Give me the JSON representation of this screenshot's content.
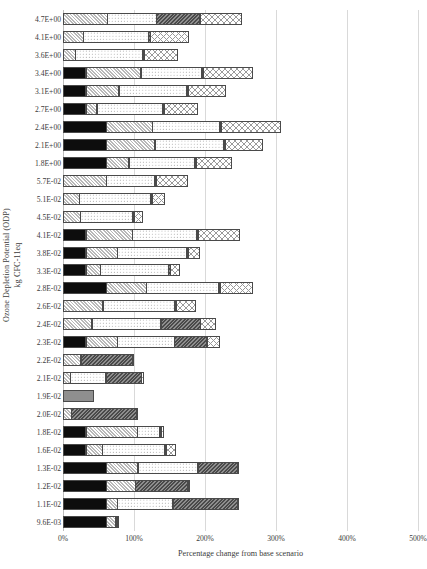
{
  "chart_data": {
    "type": "bar",
    "orientation": "horizontal",
    "stacked": true,
    "title": "",
    "xlabel": "Percentage change from base scenario",
    "ylabel": "Ozone Depletion Potential (ODP) kg CFC-11eq",
    "ylabel_lines": [
      "Ozone Depletion Potential (ODP)",
      "kg CFC-11eq"
    ],
    "xlim": [
      0,
      500
    ],
    "xticks": [
      0,
      100,
      200,
      300,
      400,
      500
    ],
    "xtick_labels": [
      "0%",
      "100%",
      "200%",
      "300%",
      "400%",
      "500%"
    ],
    "grid": true,
    "grid_axis": "x",
    "legend": "none",
    "categories": [
      "4.7E+00",
      "4.1E+00",
      "3.6E+00",
      "3.4E+00",
      "3.1E+00",
      "2.7E+00",
      "2.4E+00",
      "2.1E+00",
      "1.8E+00",
      "5.7E-02",
      "5.1E-02",
      "4.5E-02",
      "4.1E-02",
      "3.8E-02",
      "3.3E-02",
      "2.8E-02",
      "2.6E-02",
      "2.4E-02",
      "2.3E-02",
      "2.2E-02",
      "2.1E-02",
      "1.9E-02",
      "2.0E-02",
      "1.8E-02",
      "1.6E-02",
      "1.3E-02",
      "1.2E-02",
      "1.1E-02",
      "9.6E-03"
    ],
    "series": [
      {
        "name": "segment-1",
        "pattern": "p-black-dots",
        "values": [
          0,
          0,
          0,
          33,
          33,
          33,
          62,
          62,
          62,
          0,
          0,
          0,
          33,
          33,
          33,
          62,
          0,
          0,
          33,
          0,
          0,
          0,
          0,
          33,
          33,
          62,
          62,
          62,
          62
        ]
      },
      {
        "name": "segment-2",
        "pattern": "p-grey-diag",
        "values": [
          63,
          29,
          18,
          78,
          47,
          16,
          65,
          69,
          32,
          62,
          24,
          25,
          66,
          45,
          21,
          57,
          57,
          41,
          45,
          26,
          11,
          0,
          12,
          73,
          24,
          45,
          41,
          16,
          13
        ]
      },
      {
        "name": "segment-3",
        "pattern": "p-white-dots",
        "values": [
          70,
          93,
          96,
          87,
          97,
          94,
          96,
          98,
          94,
          69,
          101,
          75,
          91,
          99,
          97,
          102,
          101,
          98,
          81,
          0,
          51,
          0,
          0,
          33,
          89,
          85,
          0,
          79,
          0
        ]
      },
      {
        "name": "segment-4",
        "pattern": "p-dark-diag",
        "values": [
          62,
          3,
          3,
          3,
          3,
          3,
          3,
          3,
          3,
          3,
          3,
          3,
          3,
          3,
          3,
          3,
          3,
          57,
          47,
          73,
          51,
          0,
          93,
          3,
          3,
          57,
          75,
          92,
          3
        ]
      },
      {
        "name": "segment-5",
        "pattern": "p-check",
        "values": [
          59,
          55,
          48,
          70,
          53,
          47,
          84,
          53,
          51,
          45,
          18,
          12,
          59,
          17,
          14,
          47,
          29,
          22,
          18,
          2,
          3,
          0,
          2,
          4,
          13,
          2,
          2,
          2,
          2
        ]
      },
      {
        "name": "segment-6",
        "pattern": "p-solid-grey",
        "values": [
          0,
          0,
          0,
          0,
          0,
          0,
          0,
          0,
          0,
          0,
          0,
          0,
          0,
          0,
          0,
          0,
          0,
          0,
          0,
          0,
          0,
          43,
          0,
          0,
          0,
          0,
          0,
          0,
          0
        ]
      }
    ],
    "row_totals": [
      254,
      180,
      165,
      271,
      233,
      193,
      310,
      285,
      242,
      179,
      146,
      115,
      252,
      197,
      168,
      271,
      190,
      218,
      224,
      101,
      116,
      43,
      107,
      146,
      162,
      251,
      180,
      251,
      80
    ]
  }
}
